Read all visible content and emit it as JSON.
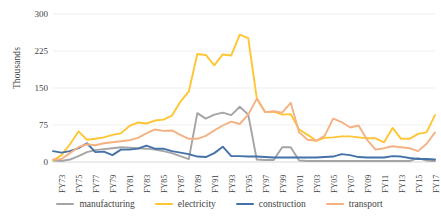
{
  "chart_data": {
    "type": "line",
    "title": "",
    "xlabel": "",
    "ylabel": "Thousands",
    "ylim": [
      0,
      300
    ],
    "yticks": [
      300,
      225,
      150,
      75,
      0
    ],
    "grid": true,
    "legend_position": "bottom",
    "x": [
      "FY73",
      "FY74",
      "FY75",
      "FY76",
      "FY77",
      "FY78",
      "FY79",
      "FY80",
      "FY81",
      "FY82",
      "FY83",
      "FY84",
      "FY85",
      "FY86",
      "FY87",
      "FY88",
      "FY89",
      "FY90",
      "FY91",
      "FY92",
      "FY93",
      "FY94",
      "FY95",
      "FY96",
      "FY97",
      "FY98",
      "FY99",
      "FY00",
      "FY01",
      "FY02",
      "FY03",
      "FY04",
      "FY05",
      "FY06",
      "FY07",
      "FY08",
      "FY09",
      "FY10",
      "FY11",
      "FY12",
      "FY13",
      "FY14",
      "FY15",
      "FY16",
      "FY17",
      "FY18"
    ],
    "xtick_labels": [
      "FY73",
      "FY75",
      "FY77",
      "FY79",
      "FY81",
      "FY83",
      "FY85",
      "FY87",
      "FY89",
      "FY91",
      "FY93",
      "FY95",
      "FY97",
      "FY99",
      "FY01",
      "FY03",
      "FY05",
      "FY07",
      "FY09",
      "FY11",
      "FY13",
      "FY15",
      "FY17"
    ],
    "series": [
      {
        "name": "manufacturing",
        "color": "#A5A5A5",
        "values": [
          3,
          2,
          5,
          12,
          20,
          24,
          26,
          28,
          30,
          29,
          28,
          27,
          25,
          22,
          18,
          12,
          6,
          99,
          88,
          96,
          100,
          95,
          112,
          96,
          5,
          4,
          4,
          30,
          30,
          3,
          2,
          2,
          2,
          2,
          2,
          2,
          2,
          2,
          2,
          2,
          2,
          2,
          2,
          8,
          3,
          2
        ]
      },
      {
        "name": "electricity",
        "color": "#FFC533",
        "values": [
          3,
          14,
          36,
          62,
          45,
          47,
          50,
          55,
          58,
          73,
          80,
          78,
          84,
          86,
          94,
          122,
          143,
          219,
          217,
          196,
          218,
          216,
          258,
          251,
          130,
          101,
          102,
          96,
          97,
          66,
          55,
          43,
          49,
          50,
          52,
          52,
          50,
          48,
          48,
          40,
          69,
          47,
          47,
          57,
          60,
          95
        ]
      },
      {
        "name": "construction",
        "color": "#4472A8",
        "values": [
          22,
          19,
          22,
          28,
          38,
          20,
          21,
          14,
          25,
          25,
          27,
          33,
          27,
          27,
          22,
          19,
          16,
          11,
          10,
          18,
          31,
          12,
          12,
          11,
          11,
          10,
          9,
          9,
          9,
          9,
          9,
          9,
          10,
          11,
          16,
          14,
          10,
          9,
          9,
          9,
          12,
          11,
          8,
          6,
          6,
          5
        ]
      },
      {
        "name": "transport",
        "color": "#F4B183",
        "values": [
          5,
          6,
          18,
          30,
          36,
          34,
          38,
          40,
          42,
          44,
          49,
          58,
          66,
          63,
          64,
          55,
          47,
          47,
          53,
          64,
          74,
          82,
          77,
          96,
          128,
          101,
          103,
          100,
          120,
          60,
          45,
          43,
          53,
          88,
          81,
          70,
          74,
          45,
          25,
          28,
          32,
          30,
          28,
          22,
          37,
          60
        ]
      }
    ],
    "legend": [
      {
        "label": "manufacturing",
        "color": "#A5A5A5"
      },
      {
        "label": "electricity",
        "color": "#FFC533"
      },
      {
        "label": "construction",
        "color": "#4472A8"
      },
      {
        "label": "transport",
        "color": "#F4B183"
      }
    ],
    "grid_color": "#EDEDED",
    "axis_color": "#D9D9D9"
  }
}
